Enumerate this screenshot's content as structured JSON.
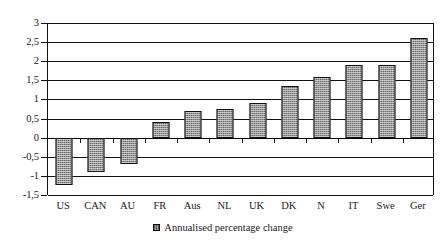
{
  "chart_data": {
    "type": "bar",
    "title": "",
    "subtitle": "",
    "xlabel": "",
    "ylabel": "",
    "categories": [
      "US",
      "CAN",
      "AU",
      "FR",
      "Aus",
      "NL",
      "UK",
      "DK",
      "N",
      "IT",
      "Swe",
      "Ger"
    ],
    "values": [
      -1.25,
      -0.9,
      -0.7,
      0.4,
      0.7,
      0.75,
      0.9,
      1.35,
      1.6,
      1.9,
      1.9,
      2.6
    ],
    "series": [
      {
        "name": "Annualised percentage change",
        "values": [
          -1.25,
          -0.9,
          -0.7,
          0.4,
          0.7,
          0.75,
          0.9,
          1.35,
          1.6,
          1.9,
          1.9,
          2.6
        ]
      }
    ],
    "ylim": [
      -1.5,
      3
    ],
    "ytick_values": [
      3,
      2.5,
      2,
      1.5,
      1,
      0.5,
      0,
      -0.5,
      -1,
      -1.5
    ],
    "ytick_labels": [
      "3",
      "2,5",
      "2",
      "1,5",
      "1",
      "0,5",
      "0",
      "-0,5",
      "-1",
      "-1,5"
    ],
    "grid": true,
    "legend_position": "bottom",
    "legend": [
      "Annualised percentage change"
    ],
    "bar_color": "#9a9a9a",
    "bar_border_color": "#111111",
    "axis_color": "#111111",
    "background_color": "#ffffff"
  },
  "legend": {
    "label": "Annualised percentage change",
    "swatch_name": "series-swatch"
  }
}
